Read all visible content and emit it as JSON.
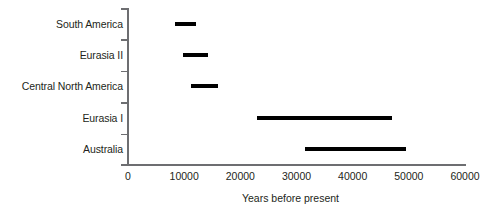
{
  "chart_data": {
    "type": "bar",
    "orientation": "horizontal",
    "subtype": "range-bar",
    "title": "",
    "xlabel": "Years before present",
    "ylabel": "",
    "xlim": [
      0,
      60000
    ],
    "xticks": [
      0,
      10000,
      20000,
      30000,
      40000,
      50000,
      60000
    ],
    "xticklabels": [
      "0",
      "10000",
      "20000",
      "30000",
      "40000",
      "50000",
      "60000"
    ],
    "grid": false,
    "legend": null,
    "bar_color": "#000000",
    "axis_color": "#6d6e71",
    "categories": [
      "South America",
      "Eurasia II",
      "Central North America",
      "Eurasia I",
      "Australia"
    ],
    "ranges": [
      {
        "category": "South America",
        "start": 8300,
        "end": 12100
      },
      {
        "category": "Eurasia II",
        "start": 9800,
        "end": 14200
      },
      {
        "category": "Central North America",
        "start": 11200,
        "end": 16000
      },
      {
        "category": "Eurasia I",
        "start": 23000,
        "end": 47000
      },
      {
        "category": "Australia",
        "start": 31500,
        "end": 49500
      }
    ]
  }
}
